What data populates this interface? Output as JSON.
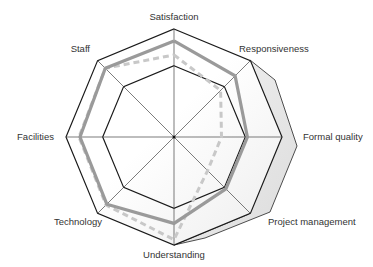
{
  "chart_data": {
    "type": "radar",
    "title": "",
    "categories": [
      "Satisfaction",
      "Responsiveness",
      "Formal quality",
      "Project management",
      "Understanding",
      "Technology",
      "Facilities",
      "Staff"
    ],
    "series": [
      {
        "name": "Series 1 (solid)",
        "style": "solid",
        "color": "#9a9a9a",
        "values": [
          89,
          80,
          68,
          68,
          80,
          88,
          87,
          90
        ]
      },
      {
        "name": "Series 2 (dashed)",
        "style": "dashed",
        "color": "#c8c8c8",
        "values": [
          76,
          61,
          44,
          44,
          95,
          89,
          88,
          90
        ]
      }
    ],
    "rings": [
      66,
      100
    ],
    "range": [
      0,
      100
    ],
    "grid": true,
    "legend": "none",
    "colors": {
      "grid": "#222222",
      "spokes": "#444444",
      "extrusion_fill": "#e4e4e4",
      "label": "#333333"
    }
  }
}
